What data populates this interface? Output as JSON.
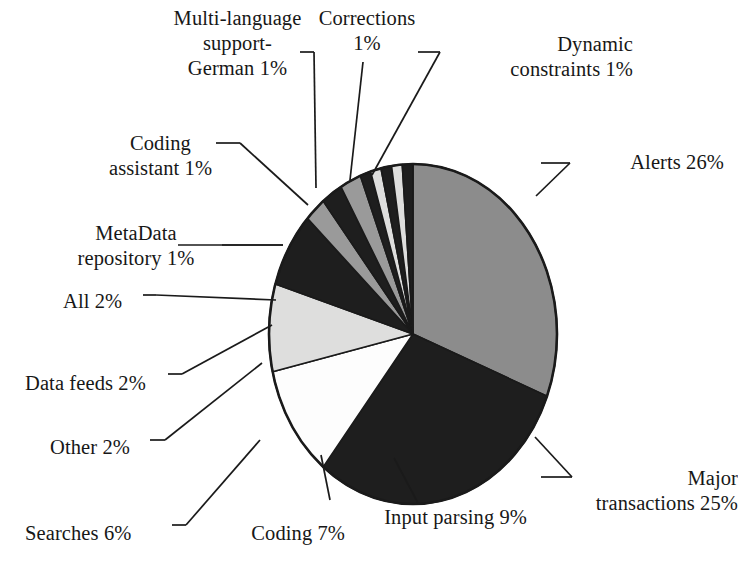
{
  "figure": {
    "background_color": "#ffffff",
    "outline_color": "#1a1a1a"
  },
  "chart_data": {
    "type": "pie",
    "title": "",
    "subtitle": "",
    "xlabel": "",
    "ylabel": "",
    "legend_position": "callout-labels",
    "grid": false,
    "units": "percent",
    "total": 100,
    "start_angle_deg": 0,
    "direction": "clockwise",
    "categories": [
      "Alerts",
      "Major transactions",
      "Input parsing",
      "Coding",
      "Searches",
      "Other",
      "Data feeds",
      "All",
      "MetaData repository",
      "Coding assistant",
      "Multi-language support-German",
      "Corrections",
      "Dynamic constraints"
    ],
    "values": [
      26,
      25,
      9,
      7,
      6,
      2,
      2,
      2,
      1,
      1,
      1,
      1,
      1
    ],
    "slice_colors": [
      "#8c8c8c",
      "#1e1e1e",
      "#fdfdfd",
      "#dededd",
      "#1e1e1e",
      "#9a9a9a",
      "#1e1e1e",
      "#9a9a9a",
      "#1e1e1e",
      "#dededd",
      "#1e1e1e",
      "#dededd",
      "#1e1e1e"
    ],
    "data_labels": [
      "Alerts 26%",
      "Major\ntransactions 25%",
      "Input parsing 9%",
      "Coding 7%",
      "Searches 6%",
      "Other 2%",
      "Data feeds 2%",
      "All 2%",
      "MetaData\nrepository 1%",
      "Coding\nassistant 1%",
      "Multi-language\nsupport-\nGerman 1%",
      "Corrections\n1%",
      "Dynamic\nconstraints 1%"
    ]
  },
  "labels": {
    "alerts": "Alerts 26%",
    "major_transactions": "Major\ntransactions 25%",
    "input_parsing": "Input parsing 9%",
    "coding": "Coding 7%",
    "searches": "Searches 6%",
    "other": "Other 2%",
    "data_feeds": "Data feeds 2%",
    "all": "All 2%",
    "metadata_repository": "MetaData\nrepository 1%",
    "coding_assistant": "Coding\nassistant 1%",
    "multi_language_support": "Multi-language\nsupport-\nGerman 1%",
    "corrections": "Corrections\n1%",
    "dynamic_constraints": "Dynamic\nconstraints 1%"
  }
}
